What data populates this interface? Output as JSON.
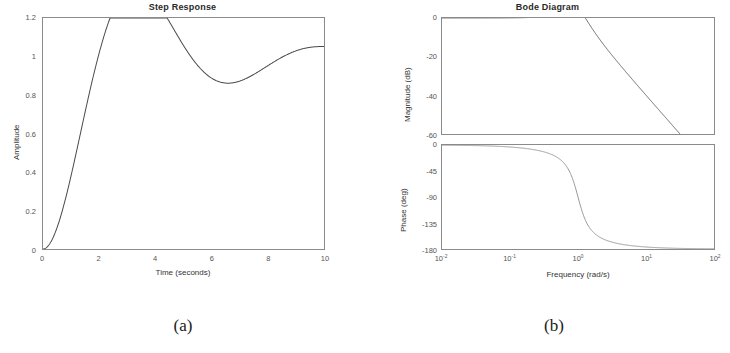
{
  "figure": {
    "captions": [
      {
        "id": "a",
        "text": "(a)"
      },
      {
        "id": "b",
        "text": "(b)"
      }
    ]
  },
  "panel_a": {
    "title": "Step Response",
    "xlabel": "Time (seconds)",
    "ylabel": "Amplitude",
    "xticks": [
      "0",
      "2",
      "4",
      "6",
      "8",
      "10"
    ],
    "yticks": [
      "0",
      "0.2",
      "0.4",
      "0.6",
      "0.8",
      "1",
      "1.2"
    ]
  },
  "panel_b": {
    "title": "Bode Diagram",
    "xlabel": "Frequency  (rad/s)",
    "mag_ylabel": "Magnitude (dB)",
    "phase_ylabel": "Phase (deg)",
    "xticks": [
      {
        "mantissa": "10",
        "exp": "-2"
      },
      {
        "mantissa": "10",
        "exp": "-1"
      },
      {
        "mantissa": "10",
        "exp": "0"
      },
      {
        "mantissa": "10",
        "exp": "1"
      },
      {
        "mantissa": "10",
        "exp": "2"
      }
    ],
    "mag_yticks": [
      "0",
      "-20",
      "-40",
      "-60"
    ],
    "phase_yticks": [
      "0",
      "-45",
      "-90",
      "-135",
      "-180"
    ]
  },
  "style": {
    "curve_color": "#4a4a4a",
    "axis_color": "#8a8a8a",
    "text_color": "#333333"
  },
  "chart_data": [
    {
      "type": "line",
      "id": "step-response",
      "title": "Step Response",
      "xlabel": "Time (seconds)",
      "ylabel": "Amplitude",
      "xlim": [
        0,
        10
      ],
      "ylim": [
        0,
        1.2
      ],
      "grid": false,
      "legend": null,
      "system": "second-order, wn = 1 rad/s, zeta = 0.3",
      "annotations": {
        "peak_value": 1.19,
        "peak_time": 1.7,
        "steady_state": 1.0,
        "overshoot_percent": 19
      },
      "x": [
        0,
        0.2,
        0.4,
        0.6,
        0.8,
        1.0,
        1.2,
        1.4,
        1.6,
        1.7,
        1.8,
        2.0,
        2.2,
        2.4,
        2.6,
        2.8,
        3.0,
        3.5,
        4.0,
        4.5,
        5.0,
        5.5,
        6.0,
        6.5,
        7.0,
        7.5,
        8.0,
        8.5,
        9.0,
        9.5,
        10.0
      ],
      "y": [
        0,
        0.0196,
        0.0743,
        0.1574,
        0.2617,
        0.3803,
        0.5063,
        0.6338,
        0.7576,
        0.8168,
        0.8736,
        0.9779,
        1.0681,
        1.143,
        1.2022,
        1.2461,
        1.2757,
        1.2914,
        1.2418,
        1.1563,
        1.0645,
        0.9903,
        0.9468,
        0.9348,
        0.9463,
        0.9703,
        0.9975,
        1.0207,
        1.0356,
        1.0411,
        1.0386
      ]
    },
    {
      "type": "line",
      "id": "bode-magnitude",
      "title": "Bode Diagram",
      "xlabel": "Frequency  (rad/s)",
      "ylabel": "Magnitude (dB)",
      "xscale": "log",
      "xlim": [
        0.01,
        100
      ],
      "ylim": [
        -60,
        0
      ],
      "grid": false,
      "slope_high_freq_db_per_decade": -40,
      "x": [
        0.01,
        0.0316,
        0.1,
        0.316,
        0.5,
        0.7,
        1.0,
        1.4,
        2.0,
        3.16,
        5.0,
        7.0,
        10.0,
        17.8,
        31.6,
        56.2,
        100.0
      ],
      "y": [
        0.0,
        0.0,
        0.01,
        0.12,
        0.4,
        1.0,
        4.4,
        0.1,
        -5.6,
        -13.0,
        -21.3,
        -27.0,
        -34.0,
        -44.0,
        -54.0,
        -64.0,
        -74.0
      ]
    },
    {
      "type": "line",
      "id": "bode-phase",
      "title": "Bode Diagram",
      "xlabel": "Frequency  (rad/s)",
      "ylabel": "Phase (deg)",
      "xscale": "log",
      "xlim": [
        0.01,
        100
      ],
      "ylim": [
        -180,
        0
      ],
      "grid": false,
      "x": [
        0.01,
        0.0316,
        0.1,
        0.2,
        0.316,
        0.5,
        0.7,
        1.0,
        1.4,
        2.0,
        3.16,
        5.0,
        7.0,
        10.0,
        17.8,
        31.6,
        56.2,
        100.0
      ],
      "y": [
        -0.3,
        -1.1,
        -3.5,
        -7.0,
        -11.2,
        -20.0,
        -32.0,
        -90.0,
        -148.0,
        -157.0,
        -167.0,
        -173.0,
        -175.0,
        -177.0,
        -178.0,
        -179.0,
        -179.5,
        -180.0
      ]
    }
  ]
}
